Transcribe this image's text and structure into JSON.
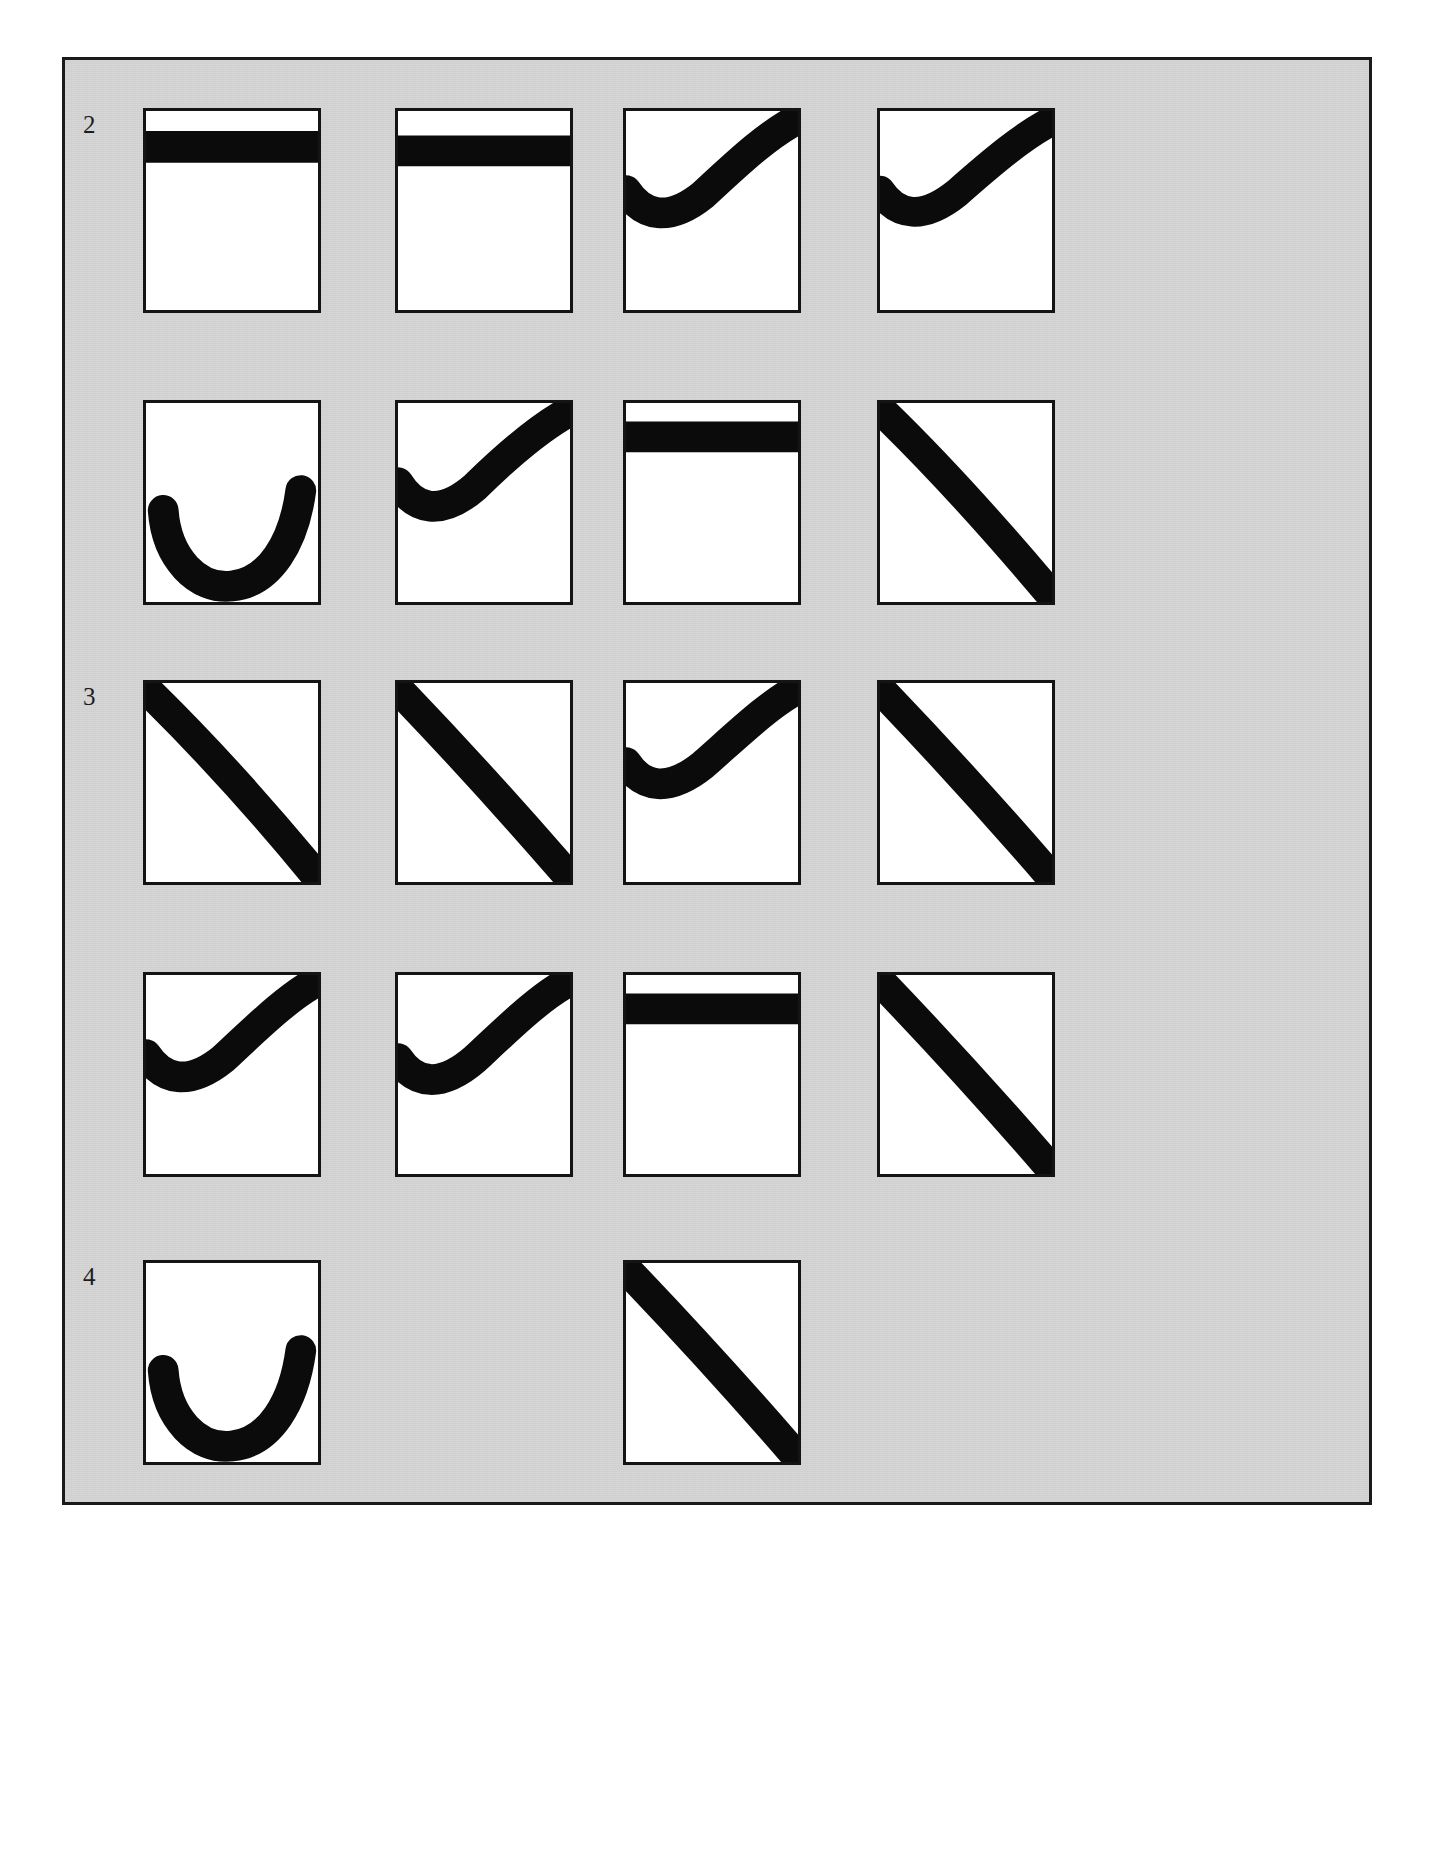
{
  "page": {
    "background_color": "#ffffff",
    "plate_background_color": "#d7d7d7",
    "frame_color": "#1a1a1a",
    "panel_border_color": "#141414",
    "panel_fill_color": "#ffffff",
    "curve_color": "#0b0b0b"
  },
  "row_labels": [
    {
      "text": "2",
      "row": 1
    },
    {
      "text": "3",
      "row": 3
    },
    {
      "text": "4",
      "row": 5
    }
  ],
  "grid": {
    "rows": 5,
    "columns": 4,
    "panel_width": 178,
    "panel_height": 205,
    "col_x": [
      78,
      330,
      558,
      812
    ],
    "row_y": [
      48,
      340,
      620,
      912,
      1200
    ]
  },
  "chart_data": {
    "type": "line",
    "title": "",
    "subtitle": "",
    "xlabel": "",
    "ylabel": "",
    "xlim": [
      0,
      1
    ],
    "ylim": [
      0,
      1
    ],
    "grid": false,
    "legend": "none",
    "panels": [
      {
        "row": 1,
        "col": 1,
        "shape": "flat-high",
        "path": "M 0,0.82 C 0.25,0.82 0.6,0.82 1,0.82",
        "stroke_width": 0.155
      },
      {
        "row": 1,
        "col": 2,
        "shape": "flat-high",
        "path": "M 0,0.80 C 0.25,0.80 0.6,0.80 1,0.80",
        "stroke_width": 0.15
      },
      {
        "row": 1,
        "col": 3,
        "shape": "valley-rise",
        "path": "M 0,0.60 C 0.10,0.47 0.25,0.44 0.45,0.58 C 0.65,0.74 0.82,0.88 1,0.96",
        "stroke_width": 0.15
      },
      {
        "row": 1,
        "col": 4,
        "shape": "valley-rise",
        "path": "M 0,0.60 C 0.10,0.47 0.25,0.45 0.45,0.59 C 0.66,0.75 0.84,0.88 1,0.95",
        "stroke_width": 0.145
      },
      {
        "row": 2,
        "col": 1,
        "shape": "u-bowl",
        "path": "M 0.10,0.46 C 0.12,0.22 0.30,0.06 0.50,0.08 C 0.72,0.10 0.86,0.30 0.90,0.56",
        "stroke_width": 0.15
      },
      {
        "row": 2,
        "col": 2,
        "shape": "valley-rise",
        "path": "M 0,0.60 C 0.10,0.46 0.25,0.43 0.45,0.58 C 0.65,0.75 0.83,0.88 1,0.96",
        "stroke_width": 0.15
      },
      {
        "row": 2,
        "col": 3,
        "shape": "flat-high",
        "path": "M 0,0.83 C 0.25,0.83 0.6,0.83 1,0.83",
        "stroke_width": 0.15
      },
      {
        "row": 2,
        "col": 4,
        "shape": "concave-fall",
        "path": "M 0,0.97 C 0.30,0.72 0.62,0.42 1,0.03",
        "stroke_width": 0.15
      },
      {
        "row": 3,
        "col": 1,
        "shape": "concave-fall",
        "path": "M 0,0.97 C 0.32,0.70 0.64,0.40 1,0.02",
        "stroke_width": 0.15
      },
      {
        "row": 3,
        "col": 2,
        "shape": "concave-fall",
        "path": "M 0,0.97 C 0.30,0.70 0.62,0.40 1,0.02",
        "stroke_width": 0.15
      },
      {
        "row": 3,
        "col": 3,
        "shape": "valley-rise",
        "path": "M 0,0.60 C 0.10,0.47 0.25,0.45 0.45,0.59 C 0.66,0.75 0.84,0.90 1,0.97",
        "stroke_width": 0.15
      },
      {
        "row": 3,
        "col": 4,
        "shape": "concave-fall",
        "path": "M 0,0.97 C 0.30,0.70 0.62,0.40 1,0.02",
        "stroke_width": 0.15
      },
      {
        "row": 4,
        "col": 1,
        "shape": "valley-rise",
        "path": "M 0,0.60 C 0.10,0.47 0.25,0.44 0.45,0.58 C 0.66,0.75 0.84,0.90 1,0.97",
        "stroke_width": 0.15
      },
      {
        "row": 4,
        "col": 2,
        "shape": "valley-rise",
        "path": "M 0,0.58 C 0.10,0.45 0.25,0.43 0.45,0.58 C 0.66,0.75 0.84,0.90 1,0.97",
        "stroke_width": 0.15
      },
      {
        "row": 4,
        "col": 3,
        "shape": "flat-high",
        "path": "M 0,0.83 C 0.25,0.83 0.6,0.83 1,0.83",
        "stroke_width": 0.15
      },
      {
        "row": 4,
        "col": 4,
        "shape": "concave-fall",
        "path": "M 0,0.97 C 0.30,0.70 0.62,0.40 1,0.02",
        "stroke_width": 0.15
      },
      {
        "row": 5,
        "col": 1,
        "shape": "u-bowl",
        "path": "M 0.10,0.46 C 0.12,0.22 0.30,0.06 0.50,0.08 C 0.72,0.10 0.86,0.30 0.90,0.56",
        "stroke_width": 0.15
      },
      {
        "row": 5,
        "col": 3,
        "shape": "concave-fall",
        "path": "M 0,0.97 C 0.30,0.70 0.62,0.40 1,0.02",
        "stroke_width": 0.15
      }
    ]
  }
}
